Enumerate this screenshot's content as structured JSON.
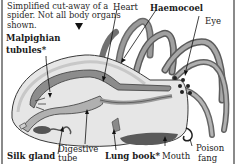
{
  "diagram": {
    "caption": "Simplified cut-away of a spider. Not all body organs shown.",
    "caption_arrow_icon": "triangle-down-icon",
    "labels": {
      "malpighian_line1": "Malpighian",
      "malpighian_line2": "tubules*",
      "heart": "Heart",
      "haemocoel": "Haemocoel",
      "eye": "Eye",
      "silk_gland": "Silk gland",
      "digestive_line1": "Digestive",
      "digestive_line2": "tube",
      "lung_book": "Lung book*",
      "mouth": "Mouth",
      "poison_line1": "Poison",
      "poison_line2": "fang"
    },
    "colors": {
      "body_fill": "#e6e6e6",
      "organ_dark": "#8c8c8c",
      "organ_mid": "#b0b0b0",
      "outline": "#3a3a3a",
      "frame": "#8a8a8a"
    }
  }
}
